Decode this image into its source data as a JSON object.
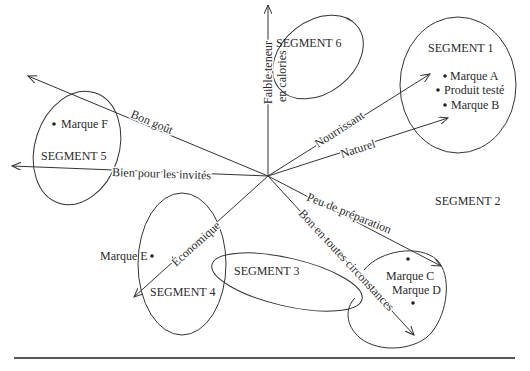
{
  "diagram": {
    "type": "perceptual-map",
    "attributes": [
      {
        "id": "faible",
        "label_line1": "Faible teneur",
        "label_line2": "en calories"
      },
      {
        "id": "nourrissant",
        "label": "Nourrissant"
      },
      {
        "id": "naturel",
        "label": "Naturel"
      },
      {
        "id": "bon_gout",
        "label": "Bon goût"
      },
      {
        "id": "invites",
        "label": "Bien pour les invités"
      },
      {
        "id": "economique",
        "label": "Économique"
      },
      {
        "id": "peu_prep",
        "label": "Peu de préparation"
      },
      {
        "id": "circonstances",
        "label": "Bon en toutes circonstances"
      }
    ],
    "segments": [
      {
        "id": "seg1",
        "label": "SEGMENT 1",
        "items": [
          "Marque A",
          "Produit testé",
          "Marque B"
        ]
      },
      {
        "id": "seg2",
        "label": "SEGMENT 2",
        "items": [
          "Marque C",
          "Marque D"
        ]
      },
      {
        "id": "seg3",
        "label": "SEGMENT 3",
        "items": []
      },
      {
        "id": "seg4",
        "label": "SEGMENT 4",
        "items": [
          "Marque E"
        ]
      },
      {
        "id": "seg5",
        "label": "SEGMENT 5",
        "items": [
          "Marque F"
        ]
      },
      {
        "id": "seg6",
        "label": "SEGMENT 6",
        "items": []
      }
    ]
  }
}
